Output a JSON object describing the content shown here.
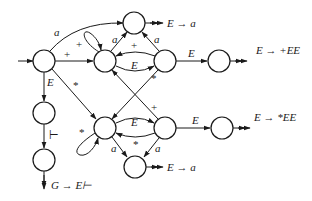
{
  "diagram": {
    "type": "state-transition-diagram",
    "nodes": [
      {
        "id": "start",
        "x": 44,
        "y": 61
      },
      {
        "id": "top",
        "x": 134,
        "y": 23
      },
      {
        "id": "upper-mid",
        "x": 105,
        "y": 61
      },
      {
        "id": "upper-right",
        "x": 165,
        "y": 61
      },
      {
        "id": "plus-ee",
        "x": 219,
        "y": 61
      },
      {
        "id": "left-2",
        "x": 44,
        "y": 113
      },
      {
        "id": "left-3",
        "x": 44,
        "y": 160
      },
      {
        "id": "lower-mid",
        "x": 105,
        "y": 128
      },
      {
        "id": "lower-right",
        "x": 165,
        "y": 128
      },
      {
        "id": "star-ee",
        "x": 222,
        "y": 128
      },
      {
        "id": "bottom",
        "x": 135,
        "y": 167
      }
    ],
    "edge_labels": {
      "start_to_top": "a",
      "start_to_upper_mid": "+",
      "start_to_left2": "E",
      "start_to_lower_mid": "*",
      "upper_mid_loop": "+",
      "upper_mid_to_top": "a",
      "upper_right_to_top": "a",
      "upper_right_to_upper_mid": "+",
      "upper_mid_to_upper_right": "E",
      "upper_right_to_plus_ee": "E",
      "upper_right_to_lower_mid": "*",
      "lower_right_to_upper_mid": "+",
      "left2_to_left3": "⊢",
      "lower_mid_loop": "*",
      "lower_mid_to_lower_right": "E",
      "lower_right_to_lower_mid": "*",
      "lower_mid_to_bottom": "a",
      "lower_right_to_bottom": "a",
      "lower_right_to_star_ee": "E"
    },
    "productions": {
      "top": "E → a",
      "plus_ee": "E → +EE",
      "star_ee": "E → *EE",
      "bottom": "E → a",
      "accept": "G → E⊢"
    }
  }
}
